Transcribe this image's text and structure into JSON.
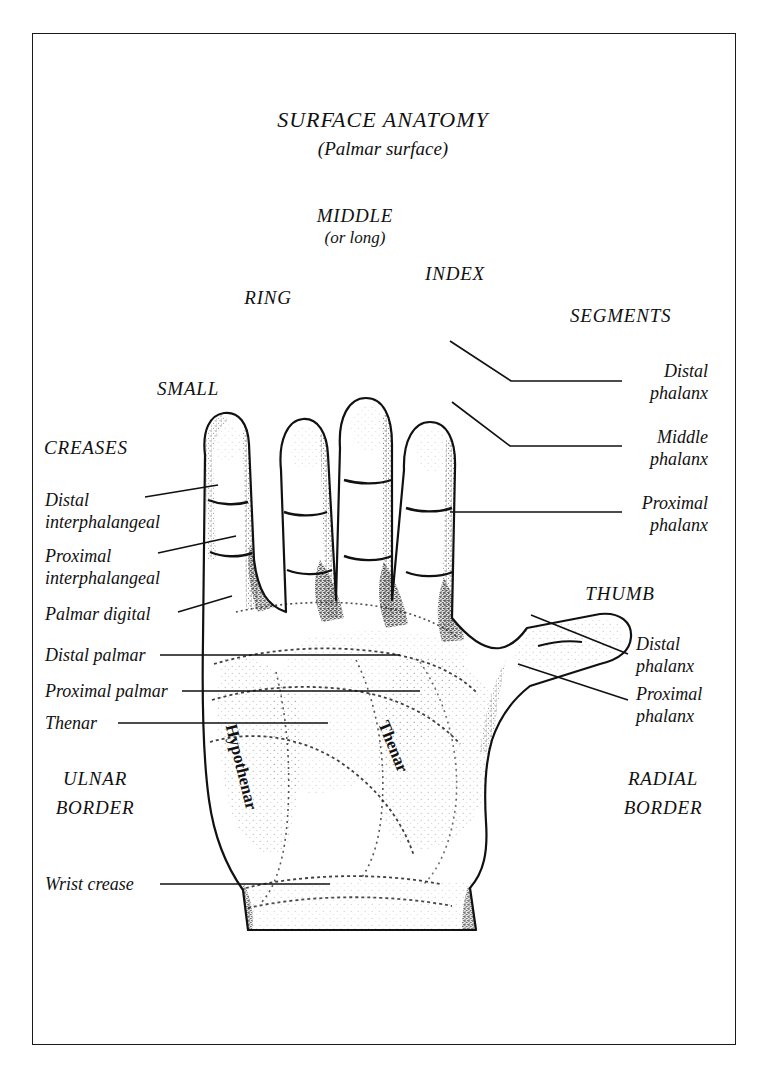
{
  "figure": {
    "title": "SURFACE ANATOMY",
    "subtitle": "(Palmar surface)"
  },
  "fingers": {
    "small": "SMALL",
    "ring": "RING",
    "middle": "MIDDLE",
    "middle_alt": "(or long)",
    "index": "INDEX",
    "thumb": "THUMB"
  },
  "groups": {
    "creases": "CREASES",
    "segments": "SEGMENTS"
  },
  "creases": [
    {
      "line1": "Distal",
      "line2": "interphalangeal"
    },
    {
      "line1": "Proximal",
      "line2": "interphalangeal"
    },
    {
      "line1": "Palmar digital",
      "line2": ""
    },
    {
      "line1": "Distal palmar",
      "line2": ""
    },
    {
      "line1": "Proximal palmar",
      "line2": ""
    },
    {
      "line1": "Thenar",
      "line2": ""
    },
    {
      "line1": "Wrist crease",
      "line2": ""
    }
  ],
  "segments": [
    {
      "line1": "Distal",
      "line2": "phalanx"
    },
    {
      "line1": "Middle",
      "line2": "phalanx"
    },
    {
      "line1": "Proximal",
      "line2": "phalanx"
    }
  ],
  "thumb_segments": [
    {
      "line1": "Distal",
      "line2": "phalanx"
    },
    {
      "line1": "Proximal",
      "line2": "phalanx"
    }
  ],
  "borders": {
    "ulnar_line1": "ULNAR",
    "ulnar_line2": "BORDER",
    "radial_line1": "RADIAL",
    "radial_line2": "BORDER"
  },
  "palm_regions": {
    "hypothenar": "Hypothenar",
    "thenar": "Thenar"
  },
  "colors": {
    "ink": "#111111",
    "paper": "#ffffff",
    "frame": "#1a1a1a"
  }
}
